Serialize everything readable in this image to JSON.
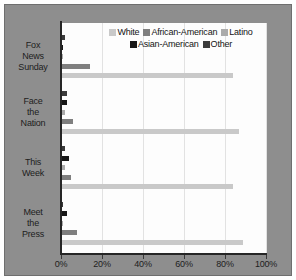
{
  "chart_data": {
    "type": "bar",
    "orientation": "horizontal",
    "title": "",
    "subtitle": "",
    "xlabel": "",
    "ylabel": "",
    "xlim": [
      0,
      100
    ],
    "xticks": [
      0,
      20,
      40,
      60,
      80,
      100
    ],
    "xtick_labels": [
      "0%",
      "20%",
      "40%",
      "60%",
      "80%",
      "100%"
    ],
    "grid": "vertical",
    "legend_position": "top-right-inside",
    "categories": [
      "Fox News Sunday",
      "Face the Nation",
      "This Week",
      "Meet the Press"
    ],
    "category_lines": [
      [
        "Fox",
        "News",
        "Sunday"
      ],
      [
        "Face",
        "the",
        "Nation"
      ],
      [
        "This",
        "Week"
      ],
      [
        "Meet",
        "the",
        "Press"
      ]
    ],
    "series": [
      {
        "name": "White",
        "color": "#c9c9c9",
        "values": [
          84,
          87,
          84,
          89
        ]
      },
      {
        "name": "African-American",
        "color": "#7f7f7f",
        "values": [
          14,
          6,
          5,
          8
        ]
      },
      {
        "name": "Latino",
        "color": "#ababab",
        "values": [
          1,
          2,
          2,
          1
        ]
      },
      {
        "name": "Asian-American",
        "color": "#171717",
        "values": [
          1,
          3,
          4,
          3
        ]
      },
      {
        "name": "Other",
        "color": "#3b3b3b",
        "values": [
          2,
          3,
          2,
          1
        ]
      }
    ],
    "bar_draw_order_top_to_bottom": [
      "Other",
      "Asian-American",
      "Latino",
      "African-American",
      "White"
    ],
    "colors": {
      "panel_background": "#8e8e8e",
      "plot_background": "#fdfdfd",
      "gridline": "#e2e2e2",
      "axis": "#262626",
      "text": "#1d1d1d"
    }
  }
}
